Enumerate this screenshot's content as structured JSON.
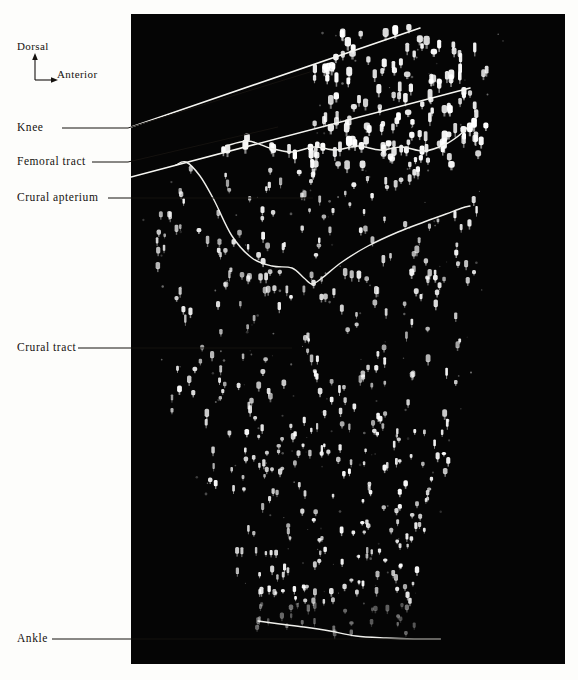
{
  "figure": {
    "kind": "anatomical-plate",
    "background_color": "#fdfdfb",
    "plate_color": "#050505",
    "ink_color": "#15120f",
    "feather_color": "#ffffff"
  },
  "orientation": {
    "dorsal_label": "Dorsal",
    "anterior_label": "Anterior"
  },
  "labels": {
    "knee": "Knee",
    "femoral_tract": "Femoral tract",
    "crural_apterium": "Crural apterium",
    "crural_tract": "Crural tract",
    "ankle": "Ankle"
  },
  "chart_data": {
    "type": "scatter",
    "title": "",
    "xlabel": "Anterior",
    "ylabel": "Dorsal",
    "plate_rect": [
      131,
      14,
      434,
      650
    ],
    "annotations": [
      {
        "name": "knee",
        "label": "Knee",
        "leader": [
          [
            62,
            128
          ],
          [
            128,
            128
          ],
          [
            310,
            72
          ]
        ],
        "feature_line": [
          [
            131,
            127
          ],
          [
            420,
            28
          ]
        ]
      },
      {
        "name": "femoral_tract",
        "label": "Femoral tract",
        "leader": [
          [
            92,
            162
          ],
          [
            128,
            162
          ],
          [
            278,
            127
          ]
        ],
        "feature_line": [
          [
            131,
            177
          ],
          [
            470,
            88
          ]
        ]
      },
      {
        "name": "crural_apterium",
        "label": "Crural apterium",
        "leader": [
          [
            108,
            198
          ],
          [
            313,
            198
          ]
        ]
      },
      {
        "name": "crural_tract",
        "label": "Crural tract",
        "leader": [
          [
            78,
            348
          ],
          [
            292,
            348
          ]
        ]
      },
      {
        "name": "ankle",
        "label": "Ankle",
        "leader": [
          [
            52,
            639
          ],
          [
            440,
            639
          ]
        ]
      }
    ],
    "curves": [
      {
        "name": "femoral-tract-row",
        "points": [
          [
            226,
            146
          ],
          [
            248,
            141
          ],
          [
            270,
            148
          ],
          [
            292,
            152
          ],
          [
            314,
            147
          ],
          [
            336,
            150
          ],
          [
            358,
            146
          ],
          [
            380,
            150
          ],
          [
            402,
            147
          ],
          [
            424,
            151
          ],
          [
            446,
            144
          ],
          [
            462,
            133
          ],
          [
            470,
            124
          ]
        ]
      },
      {
        "name": "crural-apterium-boundary",
        "points": [
          [
            176,
            165
          ],
          [
            186,
            162
          ],
          [
            200,
            176
          ],
          [
            214,
            200
          ],
          [
            232,
            236
          ],
          [
            252,
            258
          ],
          [
            272,
            266
          ],
          [
            292,
            268
          ],
          [
            304,
            278
          ],
          [
            312,
            284
          ],
          [
            322,
            278
          ],
          [
            342,
            262
          ],
          [
            368,
            246
          ],
          [
            398,
            232
          ],
          [
            424,
            222
          ],
          [
            446,
            214
          ],
          [
            462,
            208
          ],
          [
            470,
            206
          ]
        ]
      },
      {
        "name": "ankle-boundary",
        "points": [
          [
            258,
            621
          ],
          [
            280,
            624
          ],
          [
            304,
            627
          ],
          [
            330,
            631
          ],
          [
            356,
            636
          ],
          [
            386,
            638
          ],
          [
            414,
            639
          ],
          [
            440,
            639
          ]
        ]
      }
    ],
    "follicle_regions": [
      {
        "name": "femoral-tract-upper",
        "density": "high",
        "bounds": [
          300,
          20,
          500,
          150
        ]
      },
      {
        "name": "crural-tract-mid",
        "density": "medium",
        "bounds": [
          170,
          180,
          480,
          420
        ]
      },
      {
        "name": "crural-tract-lower",
        "density": "medium",
        "bounds": [
          230,
          420,
          450,
          625
        ]
      }
    ],
    "grid": false,
    "legend": null
  }
}
